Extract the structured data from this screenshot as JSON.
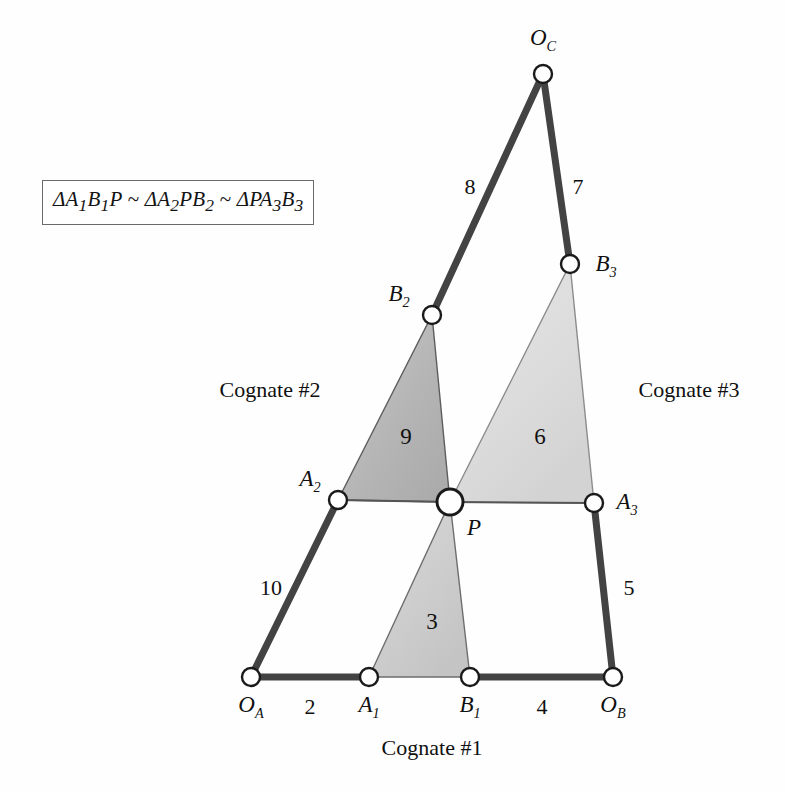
{
  "figure": {
    "type": "kinematic-cognate-linkage-diagram",
    "background_color": "#fefefe"
  },
  "formula": {
    "text": "ΔA1B1P ~ ΔA2PB2 ~ ΔPA3B3",
    "rendered": "ΔA₁B₁P ~ ΔA₂PB₂ ~ ΔPA₃B₃",
    "parts": [
      "ΔA",
      "1",
      "B",
      "1",
      "P",
      " ~ ",
      "ΔA",
      "2",
      "PB",
      "2",
      " ~ ",
      "ΔPA",
      "3",
      "B",
      "3"
    ]
  },
  "joints": [
    {
      "id": "OC",
      "label": "O",
      "sub": "C",
      "x": 543,
      "y": 74,
      "label_x": 543,
      "label_y": 40,
      "radius": 9,
      "type": "ground-pivot"
    },
    {
      "id": "B3",
      "label": "B",
      "sub": "3",
      "x": 570,
      "y": 264,
      "label_x": 606,
      "label_y": 266,
      "radius": 9,
      "type": "pin"
    },
    {
      "id": "B2",
      "label": "B",
      "sub": "2",
      "x": 432,
      "y": 315,
      "label_x": 399,
      "label_y": 296,
      "radius": 9,
      "type": "pin"
    },
    {
      "id": "A2",
      "label": "A",
      "sub": "2",
      "x": 338,
      "y": 500,
      "label_x": 310,
      "label_y": 481,
      "radius": 9,
      "type": "pin"
    },
    {
      "id": "P",
      "label": "P",
      "sub": "",
      "x": 450,
      "y": 502,
      "label_x": 474,
      "label_y": 528,
      "radius": 13,
      "type": "coupler-point"
    },
    {
      "id": "A3",
      "label": "A",
      "sub": "3",
      "x": 594,
      "y": 503,
      "label_x": 627,
      "label_y": 504,
      "radius": 9,
      "type": "pin"
    },
    {
      "id": "OA",
      "label": "O",
      "sub": "A",
      "x": 251,
      "y": 677,
      "label_x": 251,
      "label_y": 707,
      "radius": 9,
      "type": "ground-pivot"
    },
    {
      "id": "A1",
      "label": "A",
      "sub": "1",
      "x": 369,
      "y": 677,
      "label_x": 369,
      "label_y": 707,
      "radius": 9,
      "type": "pin"
    },
    {
      "id": "B1",
      "label": "B",
      "sub": "1",
      "x": 470,
      "y": 677,
      "label_x": 470,
      "label_y": 707,
      "radius": 9,
      "type": "pin"
    },
    {
      "id": "OB",
      "label": "O",
      "sub": "B",
      "x": 613,
      "y": 677,
      "label_x": 613,
      "label_y": 707,
      "radius": 9,
      "type": "ground-pivot"
    }
  ],
  "links": [
    {
      "id": "link-8",
      "from": "B2",
      "to": "OC",
      "label": "8",
      "label_x": 470,
      "label_y": 187,
      "weight": "thick"
    },
    {
      "id": "link-7",
      "from": "OC",
      "to": "B3",
      "label": "7",
      "label_x": 578,
      "label_y": 187,
      "weight": "thick"
    },
    {
      "id": "link-10",
      "from": "OA",
      "to": "A2",
      "label": "10",
      "label_x": 271,
      "label_y": 588,
      "weight": "thick"
    },
    {
      "id": "link-5",
      "from": "A3",
      "to": "OB",
      "label": "5",
      "label_x": 629,
      "label_y": 588,
      "weight": "thick"
    },
    {
      "id": "link-2",
      "from": "OA",
      "to": "A1",
      "label": "2",
      "label_x": 310,
      "label_y": 707,
      "weight": "thick"
    },
    {
      "id": "link-4",
      "from": "B1",
      "to": "OB",
      "label": "4",
      "label_x": 542,
      "label_y": 707,
      "weight": "thick"
    },
    {
      "id": "link-A2P",
      "from": "A2",
      "to": "P",
      "label": "",
      "label_x": 0,
      "label_y": 0,
      "weight": "thin"
    },
    {
      "id": "link-PA3",
      "from": "P",
      "to": "A3",
      "label": "",
      "label_x": 0,
      "label_y": 0,
      "weight": "thin"
    }
  ],
  "triangles": [
    {
      "id": "triangle-9",
      "label": "9",
      "vertices": [
        "A2",
        "B2",
        "P"
      ],
      "points": "338,500 432,315 450,502",
      "fill": "#b9b9b9",
      "stroke": "#606060",
      "label_x": 406,
      "label_y": 437
    },
    {
      "id": "triangle-6",
      "label": "6",
      "vertices": [
        "P",
        "B3",
        "A3"
      ],
      "points": "450,502 570,264 594,503",
      "fill": "#dedede",
      "stroke": "#8a8a8a",
      "label_x": 540,
      "label_y": 437
    },
    {
      "id": "triangle-3",
      "label": "3",
      "vertices": [
        "A1",
        "B1",
        "P"
      ],
      "points": "369,677 470,677 450,502",
      "fill": "#cfcfcf",
      "stroke": "#707070",
      "label_x": 432,
      "label_y": 622
    }
  ],
  "annotations": [
    {
      "id": "cognate-2",
      "text": "Cognate #2",
      "x": 270,
      "y": 390
    },
    {
      "id": "cognate-3",
      "text": "Cognate #3",
      "x": 689,
      "y": 390
    },
    {
      "id": "cognate-1",
      "text": "Cognate #1",
      "x": 432,
      "y": 748
    }
  ],
  "colors": {
    "link_stroke": "#434343",
    "joint_fill": "#ffffff",
    "joint_stroke": "#1c1c1c",
    "text": "#101010",
    "triangle_9_fill": "#b9b9b9",
    "triangle_6_fill": "#dedede",
    "triangle_3_fill": "#cfcfcf"
  }
}
